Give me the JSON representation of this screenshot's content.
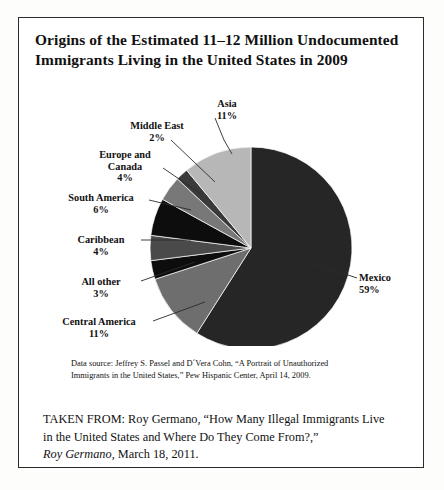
{
  "title": {
    "line1": "Origins of the Estimated 11–12 Million Undocumented",
    "line2": "Immigrants Living in the United States in 2009"
  },
  "chart_data": {
    "type": "pie",
    "title": "Origins of the Estimated 11–12 Million Undocumented Immigrants Living in the United States in 2009",
    "categories": [
      "Mexico",
      "Central America",
      "All other",
      "Caribbean",
      "South America",
      "Europe and Canada",
      "Middle East",
      "Asia"
    ],
    "values": [
      59,
      11,
      3,
      4,
      6,
      4,
      2,
      11
    ],
    "unit": "percent",
    "value_labels": [
      "59%",
      "11%",
      "3%",
      "4%",
      "6%",
      "4%",
      "2%",
      "11%"
    ],
    "colors": [
      "#262626",
      "#6e6e6e",
      "#0d0d0d",
      "#4a4a4a",
      "#0d0d0d",
      "#787878",
      "#3a3a3a",
      "#b7b7b7"
    ],
    "legend": "none",
    "labels_position": "callout-lines",
    "start_angle_deg": 0,
    "direction": "clockwise",
    "slices": [
      {
        "name": "Mexico",
        "percent": 59,
        "label": "Mexico",
        "value_label": "59%",
        "color": "#262626"
      },
      {
        "name": "Central America",
        "percent": 11,
        "label": "Central America",
        "value_label": "11%",
        "color": "#6e6e6e"
      },
      {
        "name": "All other",
        "percent": 3,
        "label": "All other",
        "value_label": "3%",
        "color": "#0d0d0d"
      },
      {
        "name": "Caribbean",
        "percent": 4,
        "label": "Caribbean",
        "value_label": "4%",
        "color": "#4a4a4a"
      },
      {
        "name": "South America",
        "percent": 6,
        "label": "South America",
        "value_label": "6%",
        "color": "#0d0d0d"
      },
      {
        "name": "Europe and Canada",
        "percent": 4,
        "label": "Europe and Canada",
        "value_label": "4%",
        "color": "#787878"
      },
      {
        "name": "Middle East",
        "percent": 2,
        "label": "Middle East",
        "value_label": "2%",
        "color": "#3a3a3a"
      },
      {
        "name": "Asia",
        "percent": 11,
        "label": "Asia",
        "value_label": "11%",
        "color": "#b7b7b7"
      }
    ]
  },
  "labels": {
    "asia": {
      "name": "Asia",
      "pct": "11%"
    },
    "me": {
      "name": "Middle East",
      "pct": "2%"
    },
    "eu": {
      "name1": "Europe and",
      "name2": "Canada",
      "pct": "4%"
    },
    "sa": {
      "name": "South America",
      "pct": "6%"
    },
    "car": {
      "name": "Caribbean",
      "pct": "4%"
    },
    "other": {
      "name": "All other",
      "pct": "3%"
    },
    "ca": {
      "name": "Central America",
      "pct": "11%"
    },
    "mex": {
      "name": "Mexico",
      "pct": "59%"
    }
  },
  "source": {
    "line1": "Data source: Jeffrey S. Passel and D´Vera Cohn, “A Portrait of Unauthorized",
    "line2": "Immigrants in the United States,” Pew Hispanic Center, April 14, 2009."
  },
  "taken_from": {
    "line1": "TAKEN FROM: Roy Germano, “How Many Illegal Immigrants Live",
    "line2": "in the United States and Where Do They Come From?,”",
    "line3_italic": "Roy Germano",
    "line3_rest": ", March 18, 2011."
  }
}
